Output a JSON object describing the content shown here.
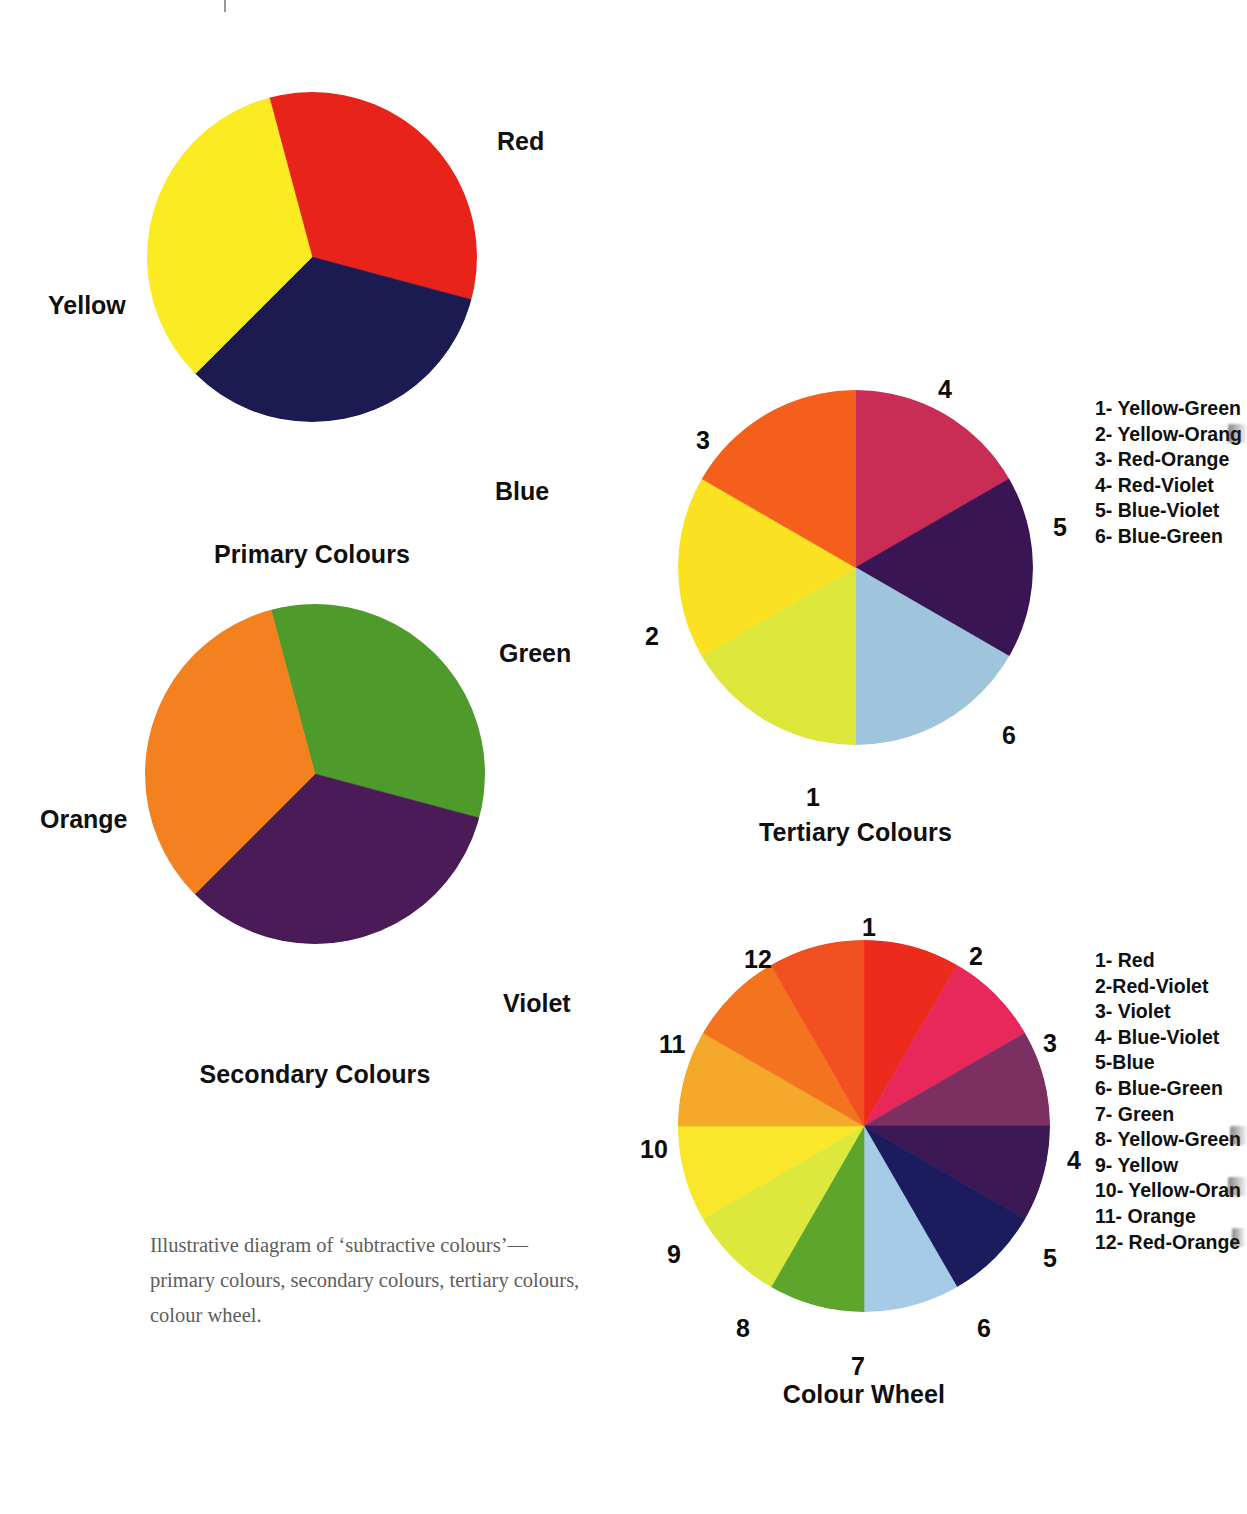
{
  "page": {
    "folio": "",
    "caption": "Illustrative diagram of ‘subtractive colours’—primary colours, secondary colours, tertiary colours, colour wheel."
  },
  "chart_data": [
    {
      "type": "pie",
      "title": "Primary Colours",
      "name": "primary-colours-wheel",
      "legend_position": "callout-labels",
      "slices": [
        {
          "label": "Red",
          "color": "#E8231A",
          "start_deg": 345,
          "sweep_deg": 120
        },
        {
          "label": "Blue",
          "color": "#1B1B52",
          "start_deg": 105,
          "sweep_deg": 120
        },
        {
          "label": "Yellow",
          "color": "#FAEB23",
          "start_deg": 225,
          "sweep_deg": 120
        }
      ],
      "callouts": [
        {
          "text": "Red",
          "x": 497,
          "y": 127
        },
        {
          "text": "Blue",
          "x": 495,
          "y": 477
        },
        {
          "text": "Yellow",
          "x": 48,
          "y": 291
        }
      ]
    },
    {
      "type": "pie",
      "title": "Secondary Colours",
      "name": "secondary-colours-wheel",
      "legend_position": "callout-labels",
      "slices": [
        {
          "label": "Green",
          "color": "#4E9B2B",
          "start_deg": 345,
          "sweep_deg": 120
        },
        {
          "label": "Violet",
          "color": "#4B1B58",
          "start_deg": 105,
          "sweep_deg": 120
        },
        {
          "label": "Orange",
          "color": "#F4811F",
          "start_deg": 225,
          "sweep_deg": 120
        }
      ],
      "callouts": [
        {
          "text": "Green",
          "x": 499,
          "y": 639
        },
        {
          "text": "Violet",
          "x": 503,
          "y": 989
        },
        {
          "text": "Orange",
          "x": 40,
          "y": 805
        }
      ]
    },
    {
      "type": "pie",
      "title": "Tertiary Colours",
      "name": "tertiary-colours-wheel",
      "legend_position": "right",
      "slices": [
        {
          "num": "4",
          "label": "Red-Violet",
          "color": "#C92C55",
          "start_deg": 0,
          "sweep_deg": 60
        },
        {
          "num": "5",
          "label": "Blue-Violet",
          "color": "#3A1554",
          "start_deg": 60,
          "sweep_deg": 60
        },
        {
          "num": "6",
          "label": "Blue-Green",
          "color": "#9FC5DD",
          "start_deg": 120,
          "sweep_deg": 60
        },
        {
          "num": "1",
          "label": "Yellow-Green",
          "color": "#DDE63A",
          "start_deg": 180,
          "sweep_deg": 60
        },
        {
          "num": "2",
          "label": "Yellow-Orange",
          "color": "#FAE223",
          "start_deg": 240,
          "sweep_deg": 60
        },
        {
          "num": "3",
          "label": "Red-Orange",
          "color": "#F4601B",
          "start_deg": 300,
          "sweep_deg": 60
        }
      ],
      "numbers": [
        {
          "text": "4",
          "x": 938,
          "y": 375
        },
        {
          "text": "3",
          "x": 696,
          "y": 426
        },
        {
          "text": "2",
          "x": 645,
          "y": 622
        },
        {
          "text": "5",
          "x": 1053,
          "y": 513
        },
        {
          "text": "6",
          "x": 1002,
          "y": 721
        },
        {
          "text": "1",
          "x": 806,
          "y": 783
        }
      ],
      "legend": [
        "1- Yellow-Green",
        "2- Yellow-Orang",
        "3- Red-Orange",
        "4- Red-Violet",
        "5- Blue-Violet",
        "6- Blue-Green"
      ]
    },
    {
      "type": "pie",
      "title": "Colour Wheel",
      "name": "colour-wheel",
      "legend_position": "right",
      "slices": [
        {
          "num": "1",
          "label": "Red",
          "color": "#EC2B1C",
          "start_deg": 0,
          "sweep_deg": 30
        },
        {
          "num": "2",
          "label": "Red-Violet",
          "color": "#E8285B",
          "start_deg": 30,
          "sweep_deg": 30
        },
        {
          "num": "3",
          "label": "Violet",
          "color": "#7B3061",
          "start_deg": 60,
          "sweep_deg": 30
        },
        {
          "num": "4",
          "label": "Blue-Violet",
          "color": "#3C1955",
          "start_deg": 90,
          "sweep_deg": 30
        },
        {
          "num": "5",
          "label": "Blue",
          "color": "#1B1B5E",
          "start_deg": 120,
          "sweep_deg": 30
        },
        {
          "num": "6",
          "label": "Blue-Green",
          "color": "#A6CBE6",
          "start_deg": 150,
          "sweep_deg": 30
        },
        {
          "num": "7",
          "label": "Green",
          "color": "#5EA52E",
          "start_deg": 180,
          "sweep_deg": 30
        },
        {
          "num": "8",
          "label": "Yellow-Green",
          "color": "#DDE83C",
          "start_deg": 210,
          "sweep_deg": 30
        },
        {
          "num": "9",
          "label": "Yellow",
          "color": "#FAE62A",
          "start_deg": 240,
          "sweep_deg": 30
        },
        {
          "num": "10",
          "label": "Yellow-Orange",
          "color": "#F5A92A",
          "start_deg": 270,
          "sweep_deg": 30
        },
        {
          "num": "11",
          "label": "Orange",
          "color": "#F4731E",
          "start_deg": 300,
          "sweep_deg": 30
        },
        {
          "num": "12",
          "label": "Red-Orange",
          "color": "#F25020",
          "start_deg": 330,
          "sweep_deg": 30
        }
      ],
      "numbers": [
        {
          "text": "1",
          "x": 862,
          "y": 913
        },
        {
          "text": "2",
          "x": 969,
          "y": 942
        },
        {
          "text": "3",
          "x": 1043,
          "y": 1029
        },
        {
          "text": "4",
          "x": 1067,
          "y": 1146
        },
        {
          "text": "5",
          "x": 1043,
          "y": 1244
        },
        {
          "text": "6",
          "x": 977,
          "y": 1314
        },
        {
          "text": "7",
          "x": 851,
          "y": 1352
        },
        {
          "text": "8",
          "x": 736,
          "y": 1314
        },
        {
          "text": "9",
          "x": 667,
          "y": 1240
        },
        {
          "text": "10",
          "x": 640,
          "y": 1135
        },
        {
          "text": "11",
          "x": 659,
          "y": 1030
        },
        {
          "text": "12",
          "x": 744,
          "y": 945
        }
      ],
      "legend": [
        "1- Red",
        "2-Red-Violet",
        "3- Violet",
        "4- Blue-Violet",
        "5-Blue",
        "6- Blue-Green",
        "7- Green",
        "8- Yellow-Green",
        "9- Yellow",
        "10- Yellow-Oran",
        "11- Orange",
        "12- Red-Orange"
      ]
    }
  ]
}
